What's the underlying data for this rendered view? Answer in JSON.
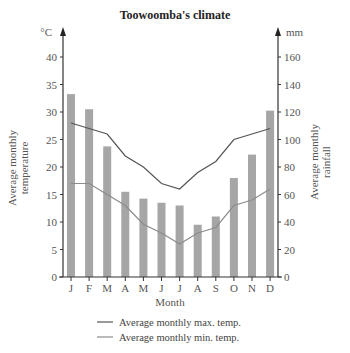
{
  "chart_data": {
    "type": "bar+line",
    "title": "Toowoomba's climate",
    "xlabel": "Month",
    "ylabel_left": "Average monthly temperature",
    "ylabel_right": "Average monthly rainfall",
    "unit_left": "°C",
    "unit_right": "mm",
    "categories": [
      "J",
      "F",
      "M",
      "A",
      "M",
      "J",
      "J",
      "A",
      "S",
      "O",
      "N",
      "D"
    ],
    "ylim_left": [
      0,
      40
    ],
    "ylim_right": [
      0,
      160
    ],
    "yticks_left": [
      0,
      5,
      10,
      15,
      20,
      25,
      30,
      35,
      40
    ],
    "yticks_right": [
      0,
      20,
      40,
      60,
      80,
      100,
      120,
      140,
      160
    ],
    "grid": false,
    "legend_position": "bottom",
    "series": [
      {
        "name": "Average monthly rainfall",
        "type": "bar",
        "axis": "right",
        "color": "#a6a6a6",
        "values": [
          133,
          122,
          95,
          62,
          57,
          54,
          52,
          38,
          44,
          72,
          89,
          121
        ]
      },
      {
        "name": "Average monthly max. temp.",
        "type": "line",
        "axis": "left",
        "color": "#555555",
        "values": [
          28,
          27,
          26,
          22,
          20,
          17,
          16,
          19,
          21,
          25,
          26,
          27
        ]
      },
      {
        "name": "Average monthly min. temp.",
        "type": "line",
        "axis": "left",
        "color": "#8c8c8c",
        "values": [
          17,
          17,
          15,
          13,
          9.6,
          8,
          6,
          8,
          9,
          13,
          14,
          16
        ]
      }
    ]
  },
  "legend": {
    "max_label": "Average monthly max. temp.",
    "min_label": "Average monthly min. temp."
  }
}
